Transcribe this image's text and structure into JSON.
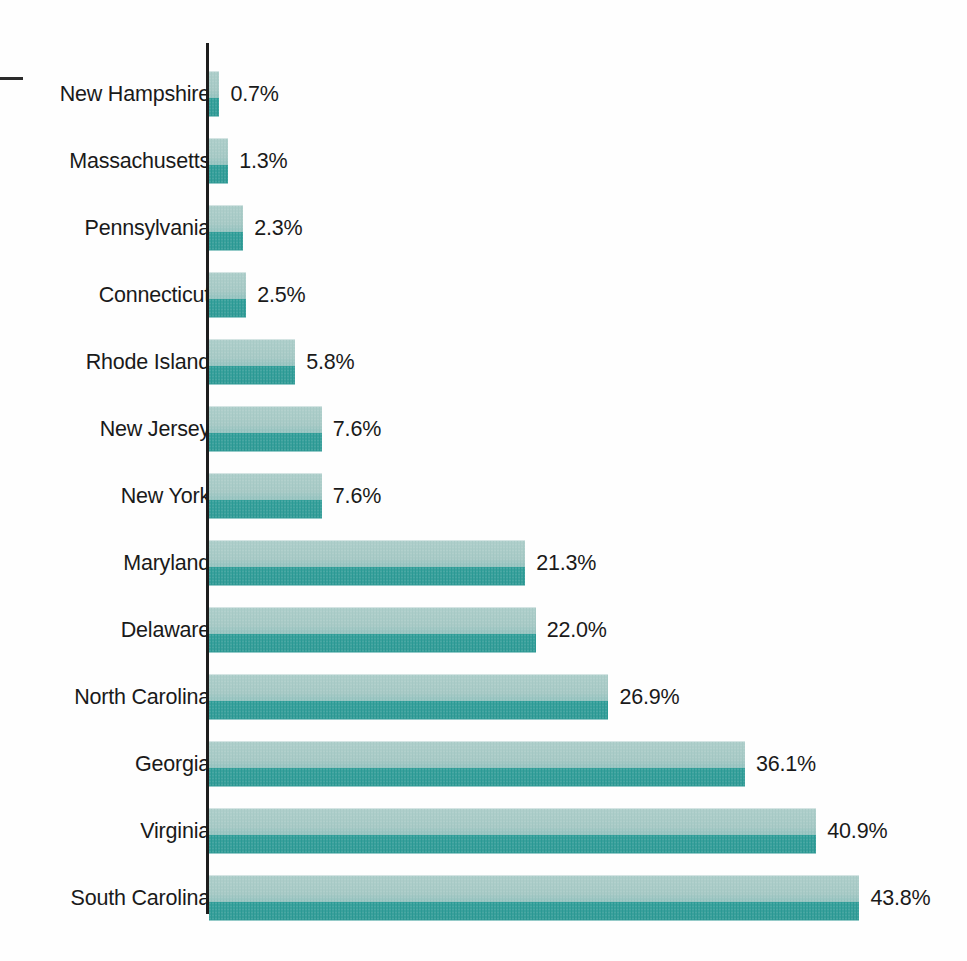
{
  "chart_data": {
    "type": "bar",
    "orientation": "horizontal",
    "title": "",
    "subtitle": "",
    "xlabel": "",
    "ylabel": "",
    "grid": false,
    "legend": null,
    "value_suffix": "%",
    "xlim": [
      0,
      43.8
    ],
    "categories": [
      "New Hampshire",
      "Massachusetts",
      "Pennsylvania",
      "Connecticut",
      "Rhode Island",
      "New Jersey",
      "New York",
      "Maryland",
      "Delaware",
      "North Carolina",
      "Georgia",
      "Virginia",
      "South Carolina"
    ],
    "values": [
      0.7,
      1.3,
      2.3,
      2.5,
      5.8,
      7.6,
      7.6,
      21.3,
      22.0,
      26.9,
      36.1,
      40.9,
      43.8
    ],
    "value_labels": [
      "0.7%",
      "1.3%",
      "2.3%",
      "2.5%",
      "5.8%",
      "7.6%",
      "7.6%",
      "21.3%",
      "22.0%",
      "26.9%",
      "36.1%",
      "40.9%",
      "43.8%"
    ],
    "colors": {
      "bar_light": "#a9cbc7",
      "bar_dark": "#2c9b96",
      "axis": "#1d1d1d",
      "text": "#1a1a1a",
      "background": "#fefefe"
    }
  },
  "marks": {
    "left_dash": ""
  }
}
